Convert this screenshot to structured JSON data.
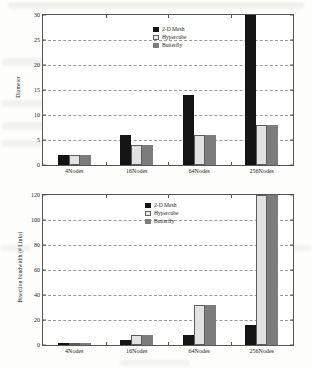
{
  "chart_data": [
    {
      "type": "bar",
      "title": "",
      "xlabel": "",
      "ylabel": "Diameter",
      "categories": [
        "4Nodes",
        "16Nodes",
        "64Nodes",
        "256Nodes"
      ],
      "series": [
        {
          "name": "2-D Mesh",
          "values": [
            2,
            6,
            14,
            30
          ],
          "color": "#141414"
        },
        {
          "name": "Hypercube",
          "values": [
            2,
            4,
            6,
            8
          ],
          "color": "#e2e2e2"
        },
        {
          "name": "Butterfly",
          "values": [
            2,
            4,
            6,
            8
          ],
          "color": "#7c7c7c"
        }
      ],
      "ylim": [
        0,
        30
      ],
      "yticks": [
        0,
        5,
        10,
        15,
        20,
        25,
        30
      ],
      "grid": true,
      "legend_position": "top-right",
      "notes": "2-D Mesh at 256Nodes reaches the top of the axis (30)"
    },
    {
      "type": "bar",
      "title": "",
      "xlabel": "",
      "ylabel": "Bisection bandwidth (# Links)",
      "categories": [
        "4Nodes",
        "16Nodes",
        "64Nodes",
        "256Nodes"
      ],
      "series": [
        {
          "name": "2-D Mesh",
          "values": [
            2,
            4,
            8,
            16
          ],
          "color": "#141414"
        },
        {
          "name": "Hypercube",
          "values": [
            2,
            8,
            32,
            128
          ],
          "color": "#e2e2e2"
        },
        {
          "name": "Butterfly",
          "values": [
            2,
            8,
            32,
            128
          ],
          "color": "#7c7c7c"
        }
      ],
      "ylim": [
        0,
        120
      ],
      "yticks": [
        0,
        20,
        40,
        60,
        80,
        100,
        120
      ],
      "grid": true,
      "legend_position": "top-center",
      "notes": "Hypercube and Butterfly at 256Nodes (128) are clipped above the 120 axis maximum"
    }
  ],
  "top_chart": {
    "ylabel": "Diameter",
    "yticks": [
      "0",
      "5",
      "10",
      "15",
      "20",
      "25",
      "30"
    ],
    "xticks": [
      "4Nodes",
      "16Nodes",
      "64Nodes",
      "256Nodes"
    ],
    "legend": [
      {
        "label": "2-D Mesh"
      },
      {
        "label": "Hypercube"
      },
      {
        "label": "Butterfly"
      }
    ]
  },
  "bottom_chart": {
    "ylabel": "Bisection bandwidth (# Links)",
    "yticks": [
      "0",
      "20",
      "40",
      "60",
      "80",
      "100",
      "120"
    ],
    "xticks": [
      "4Nodes",
      "16Nodes",
      "64Nodes",
      "256Nodes"
    ],
    "legend": [
      {
        "label": "2-D Mesh"
      },
      {
        "label": "Hypercube"
      },
      {
        "label": "Butterfly"
      }
    ]
  }
}
